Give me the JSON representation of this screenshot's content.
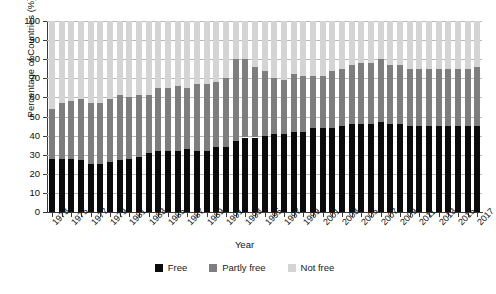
{
  "chart_data": {
    "type": "bar",
    "stacked": true,
    "title": "",
    "xlabel": "Year",
    "ylabel": "Percentage of Countries (%)",
    "ylim": [
      0,
      100
    ],
    "ytick_step": 10,
    "yticks": [
      0,
      10,
      20,
      30,
      40,
      50,
      60,
      70,
      80,
      90,
      100
    ],
    "grid": true,
    "legend_position": "bottom",
    "x": [
      1973,
      1974,
      1975,
      1976,
      1977,
      1978,
      1979,
      1980,
      1981,
      1982,
      1983,
      1984,
      1985,
      1986,
      1987,
      1988,
      1989,
      1990,
      1991,
      1992,
      1993,
      1994,
      1995,
      1996,
      1997,
      1998,
      1999,
      2000,
      2001,
      2002,
      2003,
      2004,
      2005,
      2006,
      2007,
      2008,
      2009,
      2010,
      2011,
      2012,
      2013,
      2014,
      2015,
      2016,
      2017
    ],
    "categories": [
      "1973",
      "1974",
      "1975",
      "1976",
      "1977",
      "1978",
      "1979",
      "1980",
      "1981",
      "1982",
      "1983",
      "1984",
      "1985",
      "1986",
      "1987",
      "1988",
      "1989",
      "1990",
      "1991",
      "1992",
      "1993",
      "1994",
      "1995",
      "1996",
      "1997",
      "1998",
      "1999",
      "2000",
      "2001",
      "2002",
      "2003",
      "2004",
      "2005",
      "2006",
      "2007",
      "2008",
      "2009",
      "2010",
      "2011",
      "2012",
      "2013",
      "2014",
      "2015",
      "2016",
      "2017"
    ],
    "xtick_labels": [
      "1973",
      "1975",
      "1977",
      "1979",
      "1981",
      "1983",
      "1985",
      "1987",
      "1989",
      "1991",
      "1993",
      "1995",
      "1997",
      "1999",
      "2001",
      "2003",
      "2005",
      "2007",
      "2009",
      "2011",
      "2013",
      "2015",
      "2017"
    ],
    "series": [
      {
        "name": "Free",
        "color": "#0b0b0b",
        "values": [
          28,
          28,
          28,
          27,
          25,
          25,
          26,
          27,
          28,
          29,
          31,
          32,
          32,
          32,
          33,
          32,
          32,
          34,
          34,
          37,
          39,
          39,
          40,
          41,
          41,
          42,
          42,
          44,
          44,
          44,
          45,
          46,
          46,
          46,
          47,
          46,
          46,
          45,
          45,
          45,
          45,
          45,
          45,
          45,
          45
        ]
      },
      {
        "name": "Partly free",
        "color": "#7e7e7e",
        "values": [
          26,
          29,
          30,
          32,
          32,
          32,
          33,
          34,
          32,
          32,
          30,
          33,
          33,
          34,
          32,
          35,
          35,
          34,
          36,
          43,
          41,
          37,
          34,
          29,
          28,
          30,
          29,
          27,
          27,
          30,
          30,
          31,
          32,
          32,
          33,
          31,
          31,
          30,
          30,
          30,
          30,
          30,
          30,
          30,
          31
        ]
      },
      {
        "name": "Not free",
        "color": "#d4d4d4",
        "values": [
          46,
          43,
          42,
          41,
          43,
          43,
          41,
          39,
          40,
          39,
          39,
          35,
          35,
          34,
          35,
          33,
          33,
          32,
          30,
          20,
          20,
          24,
          26,
          30,
          31,
          28,
          29,
          29,
          29,
          26,
          25,
          23,
          22,
          22,
          20,
          23,
          23,
          25,
          25,
          25,
          25,
          25,
          25,
          25,
          24
        ]
      }
    ]
  },
  "legend": {
    "items": [
      {
        "label": "Free",
        "swatch": "free-swatch"
      },
      {
        "label": "Partly free",
        "swatch": "partly-free-swatch"
      },
      {
        "label": "Not free",
        "swatch": "not-free-swatch"
      }
    ]
  },
  "colors": {
    "free": "#0b0b0b",
    "partly_free": "#7e7e7e",
    "not_free": "#d4d4d4",
    "axis": "#3a3a3a",
    "gridline": "#b9b9b9",
    "background": "#ffffff"
  }
}
